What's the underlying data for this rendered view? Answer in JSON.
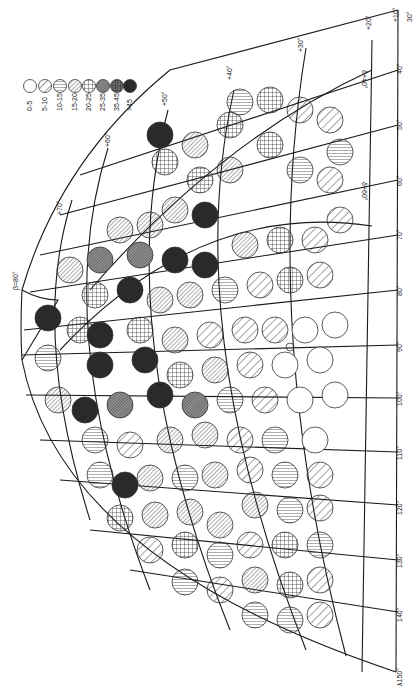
{
  "figure": {
    "orientation": "rotated-90-clockwise",
    "pole_label": "β=80°",
    "legend": {
      "title": "",
      "items": [
        {
          "range": "0-5",
          "pattern": "empty"
        },
        {
          "range": "5-10",
          "pattern": "wide-diagonal"
        },
        {
          "range": "10-15",
          "pattern": "vertical"
        },
        {
          "range": "15-20",
          "pattern": "dense-diagonal"
        },
        {
          "range": "20-25",
          "pattern": "crosshatch"
        },
        {
          "range": "25-35",
          "pattern": "dense-dark-diagonal"
        },
        {
          "range": "35-45",
          "pattern": "dark-crosshatch"
        },
        {
          "range": ">45",
          "pattern": "solid-dark"
        }
      ]
    },
    "latitude_labels": [
      "+70°",
      "+60°",
      "+50°",
      "+40°",
      "+30°",
      "+20°",
      "+10°"
    ],
    "longitude_labels": [
      "30°",
      "40°",
      "50°",
      "60°",
      "70°",
      "80°",
      "90°",
      "100°",
      "110°",
      "120°",
      "130°",
      "140°",
      "λ150°"
    ],
    "curve_labels": [
      "δ+40°",
      "δ+60°"
    ]
  },
  "colors": {
    "ink": "#1a1a1a",
    "paper": "#ffffff",
    "dark_fill": "#2a2a2a"
  }
}
